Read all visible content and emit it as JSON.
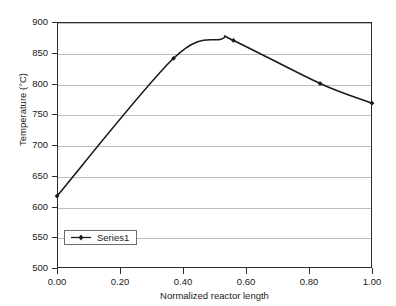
{
  "chart_data": {
    "type": "line",
    "title": "",
    "xlabel": "Normalized reactor length",
    "ylabel": "Temperature (°C)",
    "xlim": [
      0.0,
      1.0
    ],
    "ylim": [
      500,
      900
    ],
    "xticks": [
      "0.00",
      "0.20",
      "0.40",
      "0.60",
      "0.80",
      "1.00"
    ],
    "xtick_values": [
      0.0,
      0.2,
      0.4,
      0.6,
      0.8,
      1.0
    ],
    "yticks": [
      "500",
      "550",
      "600",
      "650",
      "700",
      "750",
      "800",
      "850",
      "900"
    ],
    "ytick_values": [
      500,
      550,
      600,
      650,
      700,
      750,
      800,
      850,
      900
    ],
    "grid": "horizontal",
    "legend_position": "inside-lower-left",
    "series": [
      {
        "name": "Series1",
        "marker": "diamond",
        "color": "#1a1a1a",
        "x": [
          0.0,
          0.37,
          0.56,
          0.835,
          1.0
        ],
        "values": [
          617,
          841,
          870,
          800,
          768
        ],
        "curve_peak": {
          "x": 0.52,
          "y": 872
        }
      }
    ]
  },
  "axes": {
    "y_title": "Temperature (°C)",
    "x_title": "Normalized reactor length"
  },
  "legend": {
    "entries": [
      {
        "label": "Series1"
      }
    ]
  }
}
